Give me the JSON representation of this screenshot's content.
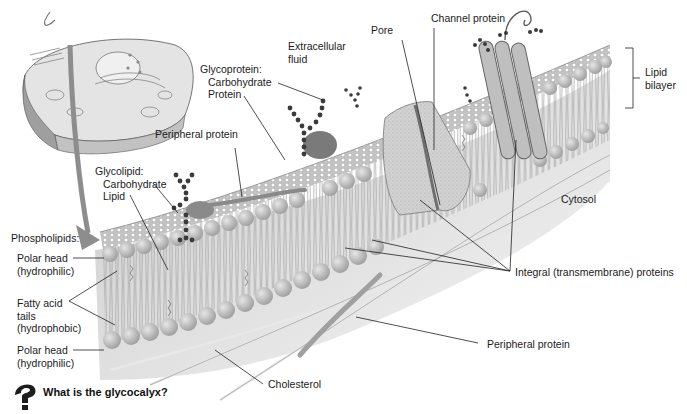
{
  "diagram": {
    "labels": {
      "extracellular_fluid": [
        "Extracellular",
        "fluid"
      ],
      "pore": "Pore",
      "channel_protein": "Channel protein",
      "lipid_bilayer": [
        "Lipid",
        "bilayer"
      ],
      "glycoprotein": {
        "heading": "Glycoprotein:",
        "carbohydrate": "Carbohydrate",
        "protein": "Protein"
      },
      "peripheral_protein_top": "Peripheral protein",
      "glycolipid": {
        "heading": "Glycolipid:",
        "carbohydrate": "Carbohydrate",
        "lipid": "Lipid"
      },
      "cytosol": "Cytosol",
      "phospholipids": "Phospholipids:",
      "polar_head_top": [
        "Polar head",
        "(hydrophilic)"
      ],
      "fatty_acid_tails": [
        "Fatty acid",
        "tails",
        "(hydrophobic)"
      ],
      "polar_head_bottom": [
        "Polar head",
        "(hydrophilic)"
      ],
      "integral_proteins": "Integral (transmembrane) proteins",
      "peripheral_protein_bottom": "Peripheral protein",
      "cholesterol": "Cholesterol"
    },
    "question": {
      "icon": "question-figure-icon",
      "text": "What is the glycocalyx?"
    },
    "colors": {
      "membrane_surface": "#bdbdbd",
      "phospholipid_head": "#c8c8c8",
      "carbohydrate_chain": "#3c3c3c",
      "protein": "#8a8a8a",
      "cytosol": "#d6d6d6",
      "leader_line": "#222222"
    }
  }
}
